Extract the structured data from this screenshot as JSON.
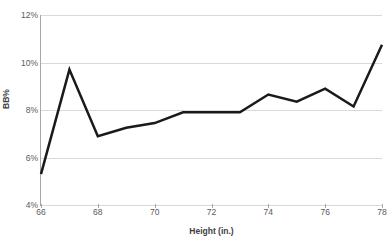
{
  "chart_data": {
    "type": "line",
    "title": "",
    "xlabel": "Height (in.)",
    "ylabel": "BB%",
    "x": [
      66,
      67,
      68,
      69,
      70,
      71,
      72,
      73,
      74,
      75,
      76,
      77,
      78
    ],
    "series": [
      {
        "name": "BB%",
        "values": [
          5.3,
          9.7,
          6.9,
          7.25,
          7.45,
          7.9,
          7.9,
          7.9,
          8.65,
          8.35,
          8.9,
          8.15,
          10.75
        ],
        "color": "#1a1a1a"
      }
    ],
    "xlim": [
      66,
      78
    ],
    "ylim": [
      4,
      12
    ],
    "xticks": [
      66,
      68,
      70,
      72,
      74,
      76,
      78
    ],
    "xtick_labels": [
      "66",
      "68",
      "70",
      "72",
      "74",
      "76",
      "78"
    ],
    "yticks": [
      4,
      6,
      8,
      10,
      12
    ],
    "ytick_labels": [
      "4%",
      "6%",
      "8%",
      "10%",
      "12%"
    ],
    "grid": true,
    "grid_axis": "y",
    "grid_color": "#d9d9d9",
    "legend": false,
    "legend_position": "none",
    "plot_background": "#ffffff",
    "axis_color": "#a6a6a6",
    "line_width": 2.5
  }
}
